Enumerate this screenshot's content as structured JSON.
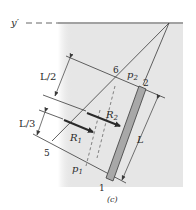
{
  "figure": {
    "caption": "(c)",
    "axis_label": "y′",
    "colors": {
      "background": "#ffffff",
      "fluid_region": "#e6e6e6",
      "bar_fill": "#a8a8a8",
      "line": "#3a3a3a"
    },
    "points": {
      "p1": "1",
      "p2": "2",
      "p5": "5",
      "p6": "6"
    },
    "pressures": {
      "p1_main": "p",
      "p1_sub": "1",
      "p2_main": "p",
      "p2_sub": "2"
    },
    "resultants": {
      "r1_main": "R",
      "r1_sub": "1",
      "r2_main": "R",
      "r2_sub": "2"
    },
    "dimensions": {
      "half": "L/2",
      "third": "L/3",
      "length": "L"
    }
  }
}
